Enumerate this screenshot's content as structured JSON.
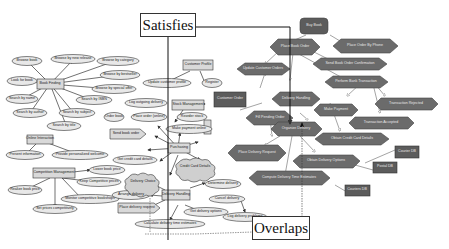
{
  "callouts": {
    "satisfies": "Satisfies",
    "overlaps": "Overlaps"
  },
  "left_model": {
    "goals": [
      {
        "id": "book_finding",
        "label": "Book Finding"
      },
      {
        "id": "online_interaction",
        "label": "Online Interaction"
      },
      {
        "id": "competition_management",
        "label": "Competition Management"
      },
      {
        "id": "customer_profile",
        "label": "Customer Profile"
      },
      {
        "id": "stock_management",
        "label": "Stock Management"
      },
      {
        "id": "purchasing",
        "label": "Purchasing"
      },
      {
        "id": "delivery_handling",
        "label": "Delivery Handling"
      },
      {
        "id": "send_book_order",
        "label": "Send book order"
      },
      {
        "id": "place_delivery_request",
        "label": "Place delivery request"
      }
    ],
    "tasks": [
      {
        "id": "browse_book",
        "label": "Browse book"
      },
      {
        "id": "browse_new_release",
        "label": "Browse by new release"
      },
      {
        "id": "browse_category",
        "label": "Browse by category"
      },
      {
        "id": "browse_bestseller",
        "label": "Browse by bestseller"
      },
      {
        "id": "browse_special_offer",
        "label": "Browse by special offer"
      },
      {
        "id": "look_for_book",
        "label": "Look for book"
      },
      {
        "id": "search_name",
        "label": "Search by name"
      },
      {
        "id": "search_isbn",
        "label": "Search by ISBN"
      },
      {
        "id": "search_author",
        "label": "Search by author"
      },
      {
        "id": "search_subject",
        "label": "Search by subject"
      },
      {
        "id": "search_title",
        "label": "Search by title"
      },
      {
        "id": "present_info",
        "label": "Present information"
      },
      {
        "id": "personalized_welcome",
        "label": "Provide personalized welcome"
      },
      {
        "id": "lower_price",
        "label": "Lower book price"
      },
      {
        "id": "keep_competitive",
        "label": "Keep Competitive prices"
      },
      {
        "id": "realize_price",
        "label": "Realize book price"
      },
      {
        "id": "monitor_competitive",
        "label": "Monitor competitive bookshops"
      },
      {
        "id": "set_prices",
        "label": "Set prices competitively"
      },
      {
        "id": "update_profile",
        "label": "Update customer profile"
      },
      {
        "id": "register",
        "label": "Register"
      },
      {
        "id": "log_outgoing",
        "label": "Log outgoing delivery"
      },
      {
        "id": "place_order_online",
        "label": "Place order (online)"
      },
      {
        "id": "reorder_stock",
        "label": "Reorder stock"
      },
      {
        "id": "order_book",
        "label": "Order book"
      },
      {
        "id": "make_payment",
        "label": "Make payment online"
      },
      {
        "id": "get_credit_card",
        "label": "Get credit card details"
      },
      {
        "id": "determine_delivery",
        "label": "Determine delivery"
      },
      {
        "id": "arrange_delivery",
        "label": "Arrange delivery"
      },
      {
        "id": "get_delivery_options",
        "label": "Get delivery options"
      },
      {
        "id": "calc_delivery_time",
        "label": "Calculate delivery time estimates"
      },
      {
        "id": "log_delivery_problems",
        "label": "Log delivery problems"
      },
      {
        "id": "cancel_delivery",
        "label": "Cancel delivery"
      }
    ],
    "softgoals": [
      {
        "id": "delivery_choice",
        "label": "Delivery Choice"
      },
      {
        "id": "credit_card_details",
        "label": "Credit Card Details"
      }
    ]
  },
  "right_model": {
    "root": {
      "id": "buy_book",
      "label": "Buy Book"
    },
    "activities": [
      {
        "id": "place_book_order",
        "label": "Place Book Order"
      },
      {
        "id": "place_order_phone",
        "label": "Place Order By Phone"
      },
      {
        "id": "update_customer_orders",
        "label": "Update Customer Orders"
      },
      {
        "id": "send_order_confirmation",
        "label": "Send Book Order Confirmation"
      },
      {
        "id": "perform_bank_transaction",
        "label": "Perform Bank Transaction"
      },
      {
        "id": "delivery_handling",
        "label": "Delivery Handling"
      },
      {
        "id": "make_payment",
        "label": "Make Payment"
      },
      {
        "id": "transaction_rejected",
        "label": "Transaction Rejected"
      },
      {
        "id": "fill_pending_order",
        "label": "Fill Pending Order"
      },
      {
        "id": "organize_delivery",
        "label": "Organize Delivery"
      },
      {
        "id": "transaction_accepted",
        "label": "Transaction Accepted"
      },
      {
        "id": "obtain_credit_card",
        "label": "Obtain Credit Card Details"
      },
      {
        "id": "place_delivery_request",
        "label": "Place Delivery Request"
      },
      {
        "id": "obtain_delivery_options",
        "label": "Obtain Delivery Options"
      },
      {
        "id": "compute_delivery_time",
        "label": "Compute Delivery Time Estimates"
      }
    ],
    "data_objects": [
      {
        "id": "customer_order",
        "label": "Customer Order"
      },
      {
        "id": "courier_db",
        "label": "Courier DB"
      },
      {
        "id": "postal_db",
        "label": "Postal DB"
      },
      {
        "id": "couriers_db",
        "label": "Couriers DB"
      }
    ]
  }
}
